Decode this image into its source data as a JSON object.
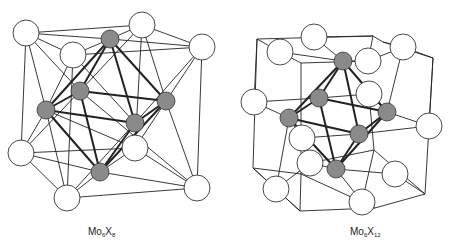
{
  "figures": [
    {
      "id": "mo6x8",
      "label_main": "Mo",
      "label_sub1": "6",
      "label_mid": "X",
      "label_sub2": "8"
    },
    {
      "id": "mo6x12",
      "label_main": "Mo",
      "label_sub1": "6",
      "label_mid": "X",
      "label_sub2": "12"
    }
  ],
  "colors": {
    "metal_atom": "#8a8a8a",
    "ligand_atom": "#ffffff",
    "bond": "#222222"
  }
}
